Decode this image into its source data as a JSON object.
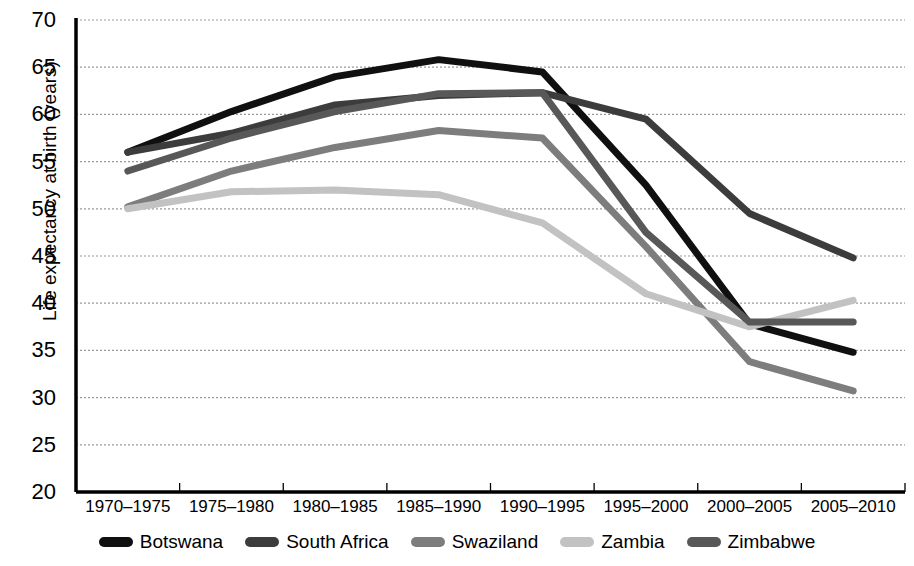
{
  "chart_data": {
    "type": "line",
    "title": "",
    "xlabel": "",
    "ylabel": "Life expectancy at birth (years)",
    "categories": [
      "1970–1975",
      "1975–1980",
      "1980–1985",
      "1985–1990",
      "1990–1995",
      "1995–2000",
      "2000–2005",
      "2005–2010"
    ],
    "ylim": [
      20,
      70
    ],
    "ytick_values": [
      20,
      25,
      30,
      35,
      40,
      45,
      50,
      55,
      60,
      65,
      70
    ],
    "ytick_labels": [
      "20",
      "25",
      "30",
      "35",
      "40",
      "45",
      "50",
      "55",
      "60",
      "65",
      "70"
    ],
    "grid": "horizontal-dotted",
    "legend_position": "bottom-center",
    "series": [
      {
        "name": "Botswana",
        "color": "#101010",
        "values": [
          56.0,
          60.3,
          64.0,
          65.8,
          64.5,
          52.5,
          37.8,
          34.8
        ]
      },
      {
        "name": "South Africa",
        "color": "#3c3c3c",
        "values": [
          56.0,
          58.0,
          61.0,
          62.0,
          62.3,
          59.5,
          49.5,
          44.8
        ]
      },
      {
        "name": "Swaziland",
        "color": "#7d7d7d",
        "values": [
          50.2,
          54.0,
          56.5,
          58.3,
          57.5,
          46.0,
          33.8,
          30.7
        ]
      },
      {
        "name": "Zambia",
        "color": "#c2c2c2",
        "values": [
          50.0,
          51.8,
          52.0,
          51.5,
          48.5,
          41.0,
          37.5,
          40.3
        ]
      },
      {
        "name": "Zimbabwe",
        "color": "#585858",
        "values": [
          54.0,
          57.5,
          60.3,
          62.2,
          62.3,
          47.5,
          38.0,
          38.0
        ]
      }
    ]
  },
  "axis": {
    "y_axis_name": "y-axis",
    "x_axis_name": "x-axis"
  }
}
